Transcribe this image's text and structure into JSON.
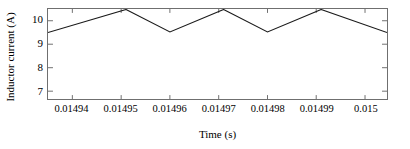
{
  "figure": {
    "width": 410,
    "height": 149,
    "background": "#ffffff",
    "line_color": "#1a1a1a",
    "frame_color": "#6f6f6f"
  },
  "chart_data": {
    "type": "line",
    "title": "",
    "xlabel": "Time (s)",
    "ylabel": "Inductor current (A)",
    "xlim": [
      0.014935,
      0.0150045
    ],
    "ylim": [
      6.666,
      10.5
    ],
    "xticks": [
      0.01494,
      0.01495,
      0.01496,
      0.01497,
      0.01498,
      0.01499,
      0.015
    ],
    "xticklabels": [
      "0.01494",
      "0.01495",
      "0.01496",
      "0.01497",
      "0.01498",
      "0.01499",
      "0.015"
    ],
    "yticks": [
      7,
      8,
      9,
      10
    ],
    "yticklabels": [
      "7",
      "8",
      "9",
      "10"
    ],
    "grid": false,
    "legend": null,
    "series": [
      {
        "name": "Inductor current",
        "x": [
          0.014935,
          0.014951,
          0.01496,
          0.014971,
          0.01498,
          0.014991,
          0.0150045
        ],
        "y": [
          9.5,
          10.48,
          9.52,
          10.48,
          9.52,
          10.48,
          9.5
        ]
      }
    ]
  },
  "axis": {
    "ylabel_text": "Inductor current (A)",
    "xlabel_text": "Time (s)"
  }
}
